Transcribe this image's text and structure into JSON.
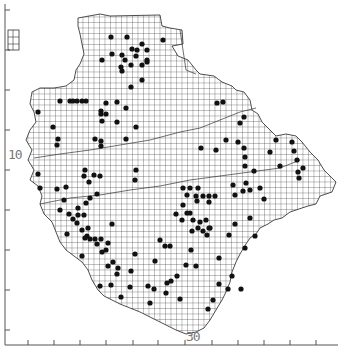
{
  "map": {
    "title": "",
    "grid_cell_px": 9,
    "colors": {
      "background": "#ffffff",
      "grid": "#222222",
      "dot": "#111111",
      "axis": "#555555",
      "label": "#777777"
    },
    "axis_labels": {
      "y_label": "10",
      "x_label": "30"
    },
    "left_ticks_y": [
      10,
      50,
      90,
      130,
      170,
      210,
      250,
      290,
      330
    ],
    "bottom_ticks_x": [
      28,
      54,
      80,
      106,
      133,
      158,
      185,
      212,
      238,
      264,
      290,
      316
    ],
    "legend_inset": {
      "x": 8,
      "y": 30,
      "w": 11,
      "h": 20
    },
    "dots": [
      [
        111,
        37
      ],
      [
        127,
        37
      ],
      [
        142,
        44
      ],
      [
        132,
        49
      ],
      [
        137,
        50
      ],
      [
        147,
        50
      ],
      [
        112,
        54
      ],
      [
        122,
        55
      ],
      [
        136,
        56
      ],
      [
        125,
        60
      ],
      [
        147,
        60
      ],
      [
        131,
        65
      ],
      [
        142,
        65
      ],
      [
        147,
        62
      ],
      [
        121,
        67
      ],
      [
        122,
        71
      ],
      [
        163,
        40
      ],
      [
        102,
        60
      ],
      [
        142,
        80
      ],
      [
        131,
        87
      ],
      [
        60,
        101
      ],
      [
        70,
        101
      ],
      [
        73,
        101
      ],
      [
        77,
        101
      ],
      [
        82,
        101
      ],
      [
        86,
        101
      ],
      [
        106,
        103
      ],
      [
        117,
        102
      ],
      [
        126,
        108
      ],
      [
        38,
        112
      ],
      [
        101,
        111
      ],
      [
        101,
        114
      ],
      [
        106,
        114
      ],
      [
        102,
        121
      ],
      [
        117,
        122
      ],
      [
        136,
        127
      ],
      [
        53,
        127
      ],
      [
        58,
        139
      ],
      [
        95,
        139
      ],
      [
        101,
        141
      ],
      [
        101,
        146
      ],
      [
        126,
        139
      ],
      [
        57,
        145
      ],
      [
        85,
        170
      ],
      [
        84,
        176
      ],
      [
        89,
        182
      ],
      [
        94,
        175
      ],
      [
        100,
        176
      ],
      [
        136,
        170
      ],
      [
        135,
        180
      ],
      [
        38,
        174
      ],
      [
        40,
        188
      ],
      [
        57,
        189
      ],
      [
        66,
        187
      ],
      [
        64,
        200
      ],
      [
        60,
        210
      ],
      [
        69,
        214
      ],
      [
        78,
        208
      ],
      [
        86,
        203
      ],
      [
        97,
        194
      ],
      [
        90,
        198
      ],
      [
        73,
        219
      ],
      [
        78,
        215
      ],
      [
        84,
        215
      ],
      [
        77,
        223
      ],
      [
        88,
        228
      ],
      [
        82,
        230
      ],
      [
        87,
        236
      ],
      [
        85,
        238
      ],
      [
        95,
        239
      ],
      [
        90,
        239
      ],
      [
        101,
        239
      ],
      [
        67,
        234
      ],
      [
        82,
        256
      ],
      [
        97,
        244
      ],
      [
        112,
        224
      ],
      [
        108,
        243
      ],
      [
        102,
        252
      ],
      [
        106,
        250
      ],
      [
        108,
        266
      ],
      [
        113,
        262
      ],
      [
        118,
        268
      ],
      [
        117,
        274
      ],
      [
        100,
        286
      ],
      [
        111,
        285
      ],
      [
        135,
        254
      ],
      [
        131,
        271
      ],
      [
        130,
        287
      ],
      [
        121,
        297
      ],
      [
        148,
        286
      ],
      [
        154,
        289
      ],
      [
        150,
        303
      ],
      [
        180,
        299
      ],
      [
        217,
        103
      ],
      [
        223,
        102
      ],
      [
        244,
        117
      ],
      [
        240,
        123
      ],
      [
        226,
        140
      ],
      [
        201,
        148
      ],
      [
        216,
        150
      ],
      [
        238,
        142
      ],
      [
        244,
        148
      ],
      [
        245,
        157
      ],
      [
        245,
        166
      ],
      [
        292,
        142
      ],
      [
        294,
        151
      ],
      [
        297,
        160
      ],
      [
        298,
        172
      ],
      [
        303,
        168
      ],
      [
        299,
        178
      ],
      [
        280,
        166
      ],
      [
        270,
        152
      ],
      [
        276,
        140
      ],
      [
        254,
        171
      ],
      [
        183,
        188
      ],
      [
        190,
        188
      ],
      [
        198,
        188
      ],
      [
        187,
        195
      ],
      [
        196,
        196
      ],
      [
        203,
        196
      ],
      [
        209,
        196
      ],
      [
        215,
        196
      ],
      [
        197,
        201
      ],
      [
        209,
        202
      ],
      [
        183,
        205
      ],
      [
        187,
        213
      ],
      [
        190,
        213
      ],
      [
        176,
        214
      ],
      [
        182,
        220
      ],
      [
        193,
        220
      ],
      [
        200,
        222
      ],
      [
        206,
        220
      ],
      [
        198,
        228
      ],
      [
        210,
        228
      ],
      [
        192,
        231
      ],
      [
        207,
        235
      ],
      [
        209,
        228
      ],
      [
        160,
        240
      ],
      [
        165,
        246
      ],
      [
        170,
        246
      ],
      [
        191,
        250
      ],
      [
        186,
        265
      ],
      [
        155,
        261
      ],
      [
        196,
        266
      ],
      [
        177,
        276
      ],
      [
        167,
        283
      ],
      [
        171,
        281
      ],
      [
        166,
        293
      ],
      [
        203,
        231
      ],
      [
        246,
        183
      ],
      [
        250,
        190
      ],
      [
        243,
        191
      ],
      [
        260,
        188
      ],
      [
        264,
        199
      ],
      [
        255,
        236
      ],
      [
        250,
        218
      ],
      [
        235,
        224
      ],
      [
        229,
        235
      ],
      [
        219,
        258
      ],
      [
        219,
        284
      ],
      [
        228,
        289
      ],
      [
        232,
        276
      ],
      [
        241,
        289
      ],
      [
        245,
        248
      ],
      [
        233,
        185
      ],
      [
        235,
        195
      ],
      [
        208,
        309
      ],
      [
        213,
        300
      ]
    ]
  }
}
